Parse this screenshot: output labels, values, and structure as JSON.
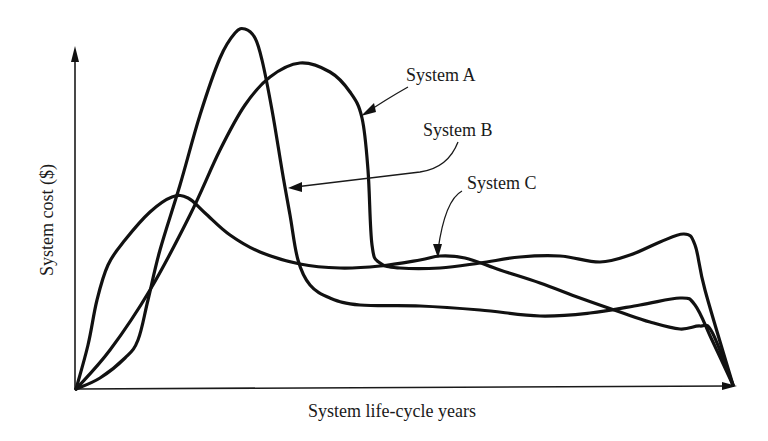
{
  "chart_data": {
    "type": "line",
    "title": "",
    "xlabel": "System life-cycle years",
    "ylabel": "System cost ($)",
    "grid": false,
    "legend": "callout-labels",
    "axis_ticks": "none",
    "x_range_px": [
      76,
      733
    ],
    "y_range_px": [
      389,
      50
    ],
    "note": "Qualitative curves; coordinates are pixel positions traced from the figure (origin at bottom-left of plot).",
    "series": [
      {
        "name": "System A",
        "label_position": [
          406,
          81
        ],
        "description": "Broad hump peaking mid-early, plateau, then drop at end of life-cycle",
        "points": [
          [
            76,
            389
          ],
          [
            110,
            350
          ],
          [
            150,
            290
          ],
          [
            190,
            215
          ],
          [
            220,
            150
          ],
          [
            245,
            105
          ],
          [
            270,
            77
          ],
          [
            300,
            63
          ],
          [
            330,
            72
          ],
          [
            350,
            92
          ],
          [
            362,
            118
          ],
          [
            368,
            170
          ],
          [
            372,
            245
          ],
          [
            380,
            263
          ],
          [
            400,
            268
          ],
          [
            440,
            268
          ],
          [
            480,
            263
          ],
          [
            520,
            257
          ],
          [
            560,
            256
          ],
          [
            600,
            262
          ],
          [
            630,
            255
          ],
          [
            660,
            242
          ],
          [
            684,
            234
          ],
          [
            695,
            245
          ],
          [
            705,
            290
          ],
          [
            733,
            385
          ]
        ]
      },
      {
        "name": "System B",
        "label_position": [
          422,
          137
        ],
        "description": "Tall narrow early peak, steep fall to low plateau, declining at end",
        "points": [
          [
            76,
            389
          ],
          [
            100,
            378
          ],
          [
            125,
            358
          ],
          [
            138,
            340
          ],
          [
            148,
            300
          ],
          [
            160,
            250
          ],
          [
            180,
            185
          ],
          [
            200,
            115
          ],
          [
            220,
            58
          ],
          [
            235,
            33
          ],
          [
            245,
            29
          ],
          [
            255,
            38
          ],
          [
            262,
            60
          ],
          [
            272,
            110
          ],
          [
            282,
            170
          ],
          [
            290,
            215
          ],
          [
            298,
            260
          ],
          [
            310,
            285
          ],
          [
            330,
            298
          ],
          [
            360,
            305
          ],
          [
            420,
            306
          ],
          [
            480,
            310
          ],
          [
            540,
            316
          ],
          [
            590,
            313
          ],
          [
            640,
            305
          ],
          [
            680,
            298
          ],
          [
            695,
            305
          ],
          [
            712,
            340
          ],
          [
            733,
            385
          ]
        ]
      },
      {
        "name": "System C",
        "label_position": [
          466,
          188
        ],
        "description": "Early small peak, dips, long oscillating plateau, then declines",
        "points": [
          [
            76,
            389
          ],
          [
            88,
            345
          ],
          [
            97,
            300
          ],
          [
            108,
            265
          ],
          [
            125,
            240
          ],
          [
            150,
            212
          ],
          [
            172,
            197
          ],
          [
            188,
            198
          ],
          [
            205,
            213
          ],
          [
            230,
            235
          ],
          [
            260,
            252
          ],
          [
            300,
            264
          ],
          [
            340,
            268
          ],
          [
            380,
            266
          ],
          [
            420,
            260
          ],
          [
            440,
            256
          ],
          [
            465,
            258
          ],
          [
            500,
            270
          ],
          [
            540,
            283
          ],
          [
            580,
            298
          ],
          [
            620,
            312
          ],
          [
            650,
            322
          ],
          [
            680,
            329
          ],
          [
            700,
            326
          ],
          [
            712,
            332
          ],
          [
            733,
            385
          ]
        ]
      }
    ],
    "callouts": [
      {
        "target": "System A",
        "from": [
          408,
          87
        ],
        "to": [
          362,
          115
        ]
      },
      {
        "target": "System B",
        "from": [
          458,
          142
        ],
        "to": [
          288,
          188
        ]
      },
      {
        "target": "System C",
        "from": [
          462,
          191
        ],
        "to": [
          437,
          257
        ]
      }
    ]
  },
  "labels": {
    "x_axis": "System life-cycle years",
    "y_axis": "System cost ($)",
    "system_a": "System A",
    "system_b": "System B",
    "system_c": "System C"
  }
}
